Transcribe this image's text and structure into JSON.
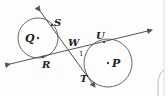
{
  "diagram": {
    "type": "geometry",
    "circles": [
      {
        "center_label": "Q",
        "cx": 38,
        "cy": 38,
        "r": 20
      },
      {
        "center_label": "P",
        "cx": 108,
        "cy": 63,
        "r": 24
      }
    ],
    "points": {
      "S": {
        "label": "S",
        "x": 53,
        "y": 24
      },
      "R": {
        "label": "R",
        "x": 43,
        "y": 57
      },
      "U": {
        "label": "U",
        "x": 104,
        "y": 41
      },
      "T": {
        "label": "T",
        "x": 92,
        "y": 81
      },
      "W": {
        "label": "W",
        "x": 73,
        "y": 50
      }
    },
    "angle_label": "1",
    "lines": [
      {
        "name": "line-ST",
        "through": [
          "S",
          "W",
          "T"
        ],
        "arrows": "both"
      },
      {
        "name": "line-RU",
        "through": [
          "R",
          "W",
          "U"
        ],
        "arrows": "both"
      }
    ],
    "line_color": "#555555",
    "label_color": "#222222"
  }
}
